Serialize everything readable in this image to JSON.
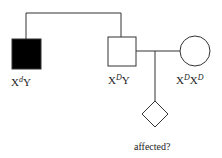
{
  "diagram": {
    "type": "pedigree",
    "individuals": [
      {
        "id": "brother",
        "shape": "square",
        "affected": true,
        "genotype": {
          "base1": "X",
          "sup1": "d",
          "base2": "Y",
          "sup2": ""
        }
      },
      {
        "id": "father",
        "shape": "square",
        "affected": false,
        "genotype": {
          "base1": "X",
          "sup1": "D",
          "base2": "Y",
          "sup2": ""
        }
      },
      {
        "id": "mother",
        "shape": "circle",
        "affected": false,
        "genotype": {
          "base1": "X",
          "sup1": "D",
          "base2": "X",
          "sup2": "D"
        }
      },
      {
        "id": "child",
        "shape": "diamond",
        "affected": null,
        "label": "affected?"
      }
    ],
    "colors": {
      "line": "#333333",
      "affected_fill": "#000000",
      "unaffected_fill": "#ffffff"
    }
  }
}
